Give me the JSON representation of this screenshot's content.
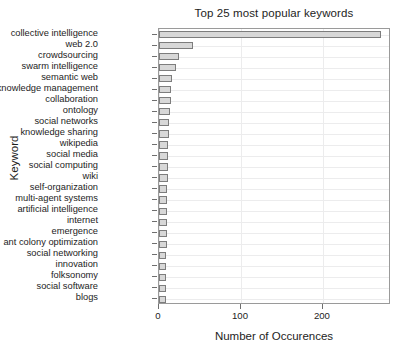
{
  "chart_data": {
    "type": "bar",
    "orientation": "horizontal",
    "title": "Top 25 most popular keywords",
    "xlabel": "Number of Occurences",
    "ylabel": "Keyword",
    "xlim": [
      0,
      283
    ],
    "xticks": [
      0,
      100,
      200
    ],
    "xtick_labels": [
      "0",
      "100",
      "200"
    ],
    "grid": true,
    "legend": "none",
    "bar_fill_color": "#d8d8d8",
    "bar_edge_color": "#7d7d7d",
    "categories": [
      "collective intelligence",
      "web 2.0",
      "crowdsourcing",
      "swarm intelligence",
      "semantic web",
      "knowledge management",
      "collaboration",
      "ontology",
      "social networks",
      "knowledge sharing",
      "wikipedia",
      "social media",
      "social computing",
      "wiki",
      "self-organization",
      "multi-agent systems",
      "artificial intelligence",
      "internet",
      "emergence",
      "ant colony optimization",
      "social networking",
      "innovation",
      "folksonomy",
      "social software",
      "blogs"
    ],
    "values": [
      271,
      41,
      24,
      21,
      16,
      15,
      15,
      14,
      12,
      12,
      11,
      11,
      11,
      11,
      10,
      10,
      10,
      10,
      10,
      10,
      9,
      9,
      9,
      8,
      8
    ]
  }
}
